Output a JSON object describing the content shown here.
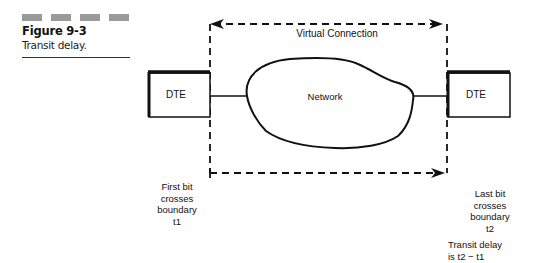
{
  "figure": {
    "number": "Figure 9-3",
    "title": "Transit delay."
  },
  "diagram": {
    "virtual_connection_label": "Virtual Connection",
    "network_label": "Network",
    "left_node_label": "DTE",
    "right_node_label": "DTE",
    "left_annotation": [
      "First bit",
      "crosses",
      "boundary",
      "t1"
    ],
    "right_annotation": [
      "Last bit",
      "crosses",
      "boundary",
      "t2"
    ],
    "delay_annotation": [
      "Transit delay",
      "is t2 − t1"
    ]
  }
}
